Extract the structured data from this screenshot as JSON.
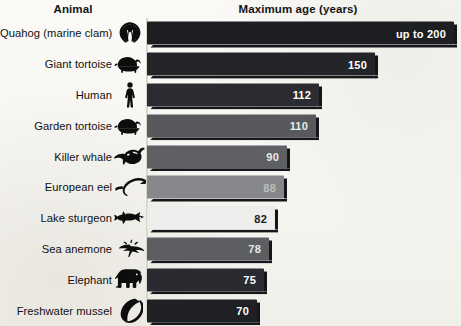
{
  "header": {
    "animal_label": "Animal",
    "age_label": "Maximum age (years)"
  },
  "chart_data": {
    "type": "bar",
    "orientation": "horizontal",
    "title": "Maximum age (years)",
    "xlabel": "Maximum age (years)",
    "ylabel": "Animal",
    "xlim": [
      0,
      200
    ],
    "grid": false,
    "legend": false,
    "categories": [
      "Quahog (marine clam)",
      "Giant tortoise",
      "Human",
      "Garden tortoise",
      "Killer whale",
      "European eel",
      "Lake sturgeon",
      "Sea anemone",
      "Elephant",
      "Freshwater mussel"
    ],
    "values": [
      200,
      150,
      112,
      110,
      90,
      88,
      82,
      78,
      75,
      70
    ],
    "value_labels": [
      "up to 200",
      "150",
      "112",
      "110",
      "90",
      "88",
      "82",
      "78",
      "75",
      "70"
    ]
  },
  "rows": [
    {
      "label": "Quahog (marine clam)",
      "value_label": "up to 200",
      "value": 200,
      "icon": "clam-shell-icon",
      "bar_color": "#1d1e22",
      "text_color": "#ffffff",
      "label_outside": false,
      "width_px": 307
    },
    {
      "label": "Giant tortoise",
      "value_label": "150",
      "value": 150,
      "icon": "tortoise-icon",
      "bar_color": "#232428",
      "text_color": "#ffffff",
      "label_outside": false,
      "width_px": 228
    },
    {
      "label": "Human",
      "value_label": "112",
      "value": 112,
      "icon": "human-icon",
      "bar_color": "#2b2c31",
      "text_color": "#ffffff",
      "label_outside": false,
      "width_px": 172
    },
    {
      "label": "Garden tortoise",
      "value_label": "110",
      "value": 110,
      "icon": "tortoise-icon",
      "bar_color": "#58595d",
      "text_color": "#e9e9e9",
      "label_outside": false,
      "width_px": 169
    },
    {
      "label": "Killer whale",
      "value_label": "90",
      "value": 90,
      "icon": "orca-icon",
      "bar_color": "#5f6064",
      "text_color": "#e9e9e9",
      "label_outside": false,
      "width_px": 140
    },
    {
      "label": "European eel",
      "value_label": "88",
      "value": 88,
      "icon": "eel-icon",
      "bar_color": "#86878a",
      "text_color": "#bdbdbd",
      "label_outside": false,
      "width_px": 137
    },
    {
      "label": "Lake sturgeon",
      "value_label": "82",
      "value": 82,
      "icon": "sturgeon-icon",
      "bar_color": "#eeeeec",
      "text_color": "#1b1b1b",
      "label_outside": false,
      "width_px": 128
    },
    {
      "label": "Sea anemone",
      "value_label": "78",
      "value": 78,
      "icon": "anemone-icon",
      "bar_color": "#5d5e62",
      "text_color": "#e9e9e9",
      "label_outside": false,
      "width_px": 122
    },
    {
      "label": "Elephant",
      "value_label": "75",
      "value": 75,
      "icon": "elephant-icon",
      "bar_color": "#2a2b30",
      "text_color": "#ffffff",
      "label_outside": false,
      "width_px": 117
    },
    {
      "label": "Freshwater mussel",
      "value_label": "70",
      "value": 70,
      "icon": "mussel-icon",
      "bar_color": "#1f2024",
      "text_color": "#ffffff",
      "label_outside": false,
      "width_px": 110
    }
  ]
}
